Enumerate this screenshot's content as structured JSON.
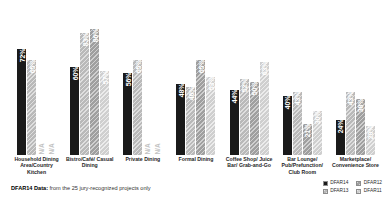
{
  "chart_data": {
    "type": "bar",
    "title": "",
    "xlabel": "",
    "ylabel": "",
    "ylim": [
      0,
      100
    ],
    "grid": false,
    "legend_position": "bottom-right",
    "categories": [
      "Household Dining Area/Country Kitchen",
      "Bistro/Café/ Casual Dining",
      "Private Dining",
      "Formal Dining",
      "Coffee Shop/ Juice Bar/ Grab-and-Go",
      "Bar Lounge/ Pub/Prefunction/ Club Room",
      "Marketplace/ Convenience Store"
    ],
    "series": [
      {
        "name": "DFAR14",
        "color": "#1a1a1a",
        "values": [
          72,
          60,
          56,
          48,
          44,
          40,
          24
        ]
      },
      {
        "name": "DFAR13",
        "color": "#b9b9b9",
        "values": [
          65,
          83,
          65,
          46,
          52,
          43,
          43
        ]
      },
      {
        "name": "DFAR12",
        "color": "#9f9f9f",
        "values": [
          null,
          86,
          null,
          65,
          50,
          21,
          38
        ]
      },
      {
        "name": "DFAR11",
        "color": "#cfcfcf",
        "values": [
          null,
          57,
          null,
          53,
          63,
          30,
          20
        ]
      }
    ],
    "na_label": "N/A",
    "value_suffix": "%"
  },
  "groups": [
    {
      "label": "Household Dining Area/Country Kitchen",
      "bars": [
        {
          "series": "DFAR14",
          "value": 72,
          "text": "72%",
          "na": false
        },
        {
          "series": "DFAR13",
          "value": 65,
          "text": "65%",
          "na": false
        },
        {
          "series": "DFAR12",
          "value": null,
          "text": "N/A",
          "na": true
        },
        {
          "series": "DFAR11",
          "value": null,
          "text": "N/A",
          "na": true
        }
      ]
    },
    {
      "label": "Bistro/Café/ Casual Dining",
      "bars": [
        {
          "series": "DFAR14",
          "value": 60,
          "text": "60%",
          "na": false
        },
        {
          "series": "DFAR13",
          "value": 83,
          "text": "83%",
          "na": false
        },
        {
          "series": "DFAR12",
          "value": 86,
          "text": "86%",
          "na": false
        },
        {
          "series": "DFAR11",
          "value": 57,
          "text": "57%",
          "na": false
        }
      ]
    },
    {
      "label": "Private Dining",
      "bars": [
        {
          "series": "DFAR14",
          "value": 56,
          "text": "56%",
          "na": false
        },
        {
          "series": "DFAR13",
          "value": 65,
          "text": "65%",
          "na": false
        },
        {
          "series": "DFAR12",
          "value": null,
          "text": "N/A",
          "na": true
        },
        {
          "series": "DFAR11",
          "value": null,
          "text": "N/A",
          "na": true
        }
      ]
    },
    {
      "label": "Formal Dining",
      "bars": [
        {
          "series": "DFAR14",
          "value": 48,
          "text": "48%",
          "na": false
        },
        {
          "series": "DFAR13",
          "value": 46,
          "text": "46%",
          "na": false
        },
        {
          "series": "DFAR12",
          "value": 65,
          "text": "65%",
          "na": false
        },
        {
          "series": "DFAR11",
          "value": 53,
          "text": "53%",
          "na": false
        }
      ]
    },
    {
      "label": "Coffee Shop/ Juice Bar/ Grab-and-Go",
      "bars": [
        {
          "series": "DFAR14",
          "value": 44,
          "text": "44%",
          "na": false
        },
        {
          "series": "DFAR13",
          "value": 52,
          "text": "52%",
          "na": false
        },
        {
          "series": "DFAR12",
          "value": 50,
          "text": "50%",
          "na": false
        },
        {
          "series": "DFAR11",
          "value": 63,
          "text": "63%",
          "na": false
        }
      ]
    },
    {
      "label": "Bar Lounge/ Pub/Prefunction/ Club Room",
      "bars": [
        {
          "series": "DFAR14",
          "value": 40,
          "text": "40%",
          "na": false
        },
        {
          "series": "DFAR13",
          "value": 43,
          "text": "43%",
          "na": false
        },
        {
          "series": "DFAR12",
          "value": 21,
          "text": "21%",
          "na": false
        },
        {
          "series": "DFAR11",
          "value": 30,
          "text": "30%",
          "na": false
        }
      ]
    },
    {
      "label": "Marketplace/ Convenience Store",
      "bars": [
        {
          "series": "DFAR14",
          "value": 24,
          "text": "24%",
          "na": false
        },
        {
          "series": "DFAR13",
          "value": 43,
          "text": "43%",
          "na": false
        },
        {
          "series": "DFAR12",
          "value": 38,
          "text": "38%",
          "na": false
        },
        {
          "series": "DFAR11",
          "value": 20,
          "text": "20%",
          "na": false
        }
      ]
    }
  ],
  "footnote": {
    "lead": "DFAR14 Data:",
    "rest": " from the 25 jury-recognized projects only"
  },
  "legend": {
    "items": [
      {
        "label": "DFAR14",
        "color": "#1a1a1a"
      },
      {
        "label": "DFAR12",
        "color": "#9f9f9f"
      },
      {
        "label": "DFAR13",
        "color": "#b9b9b9"
      },
      {
        "label": "DFAR11",
        "color": "#cfcfcf"
      }
    ]
  }
}
